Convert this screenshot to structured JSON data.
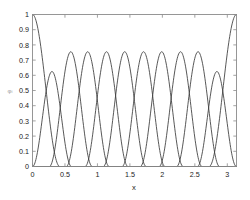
{
  "figure": {
    "background_color": "#ffffff",
    "frame_color": "#8c8c8c",
    "curve_color": "#3a3a3a"
  },
  "axes": {
    "xlabel": "x",
    "ylabel": "φᵢ",
    "x_ticks": [
      "0",
      "0.5",
      "1",
      "1.5",
      "2",
      "2.5",
      "3"
    ],
    "y_ticks": [
      "0",
      "0.1",
      "0.2",
      "0.3",
      "0.4",
      "0.5",
      "0.6",
      "0.7",
      "0.8",
      "0.9",
      "1"
    ]
  },
  "chart_data": {
    "type": "line",
    "title": "",
    "xlabel": "x",
    "ylabel": "φᵢ",
    "xlim": [
      0,
      3.14159
    ],
    "ylim": [
      0,
      1
    ],
    "xticks": [
      0,
      0.5,
      1,
      1.5,
      2,
      2.5,
      3
    ],
    "xticklabels": [
      "0",
      "0.5",
      "1",
      "1.5",
      "2",
      "2.5",
      "3"
    ],
    "yticks": [
      0,
      0.1,
      0.2,
      0.3,
      0.4,
      0.5,
      0.6,
      0.7,
      0.8,
      0.9,
      1
    ],
    "yticklabels": [
      "0",
      "0.1",
      "0.2",
      "0.3",
      "0.4",
      "0.5",
      "0.6",
      "0.7",
      "0.8",
      "0.9",
      "1"
    ],
    "grid": false,
    "legend": false,
    "legend_position": "none",
    "n_curves": 12,
    "peak_interior": 0.755,
    "peak_near_edge": 0.625,
    "crossing_upper": 0.5,
    "crossing_lower": 0.13,
    "series": [
      {
        "name": "phi_0",
        "type": "boundary-left",
        "peak_x": 0.0,
        "peak_y": 1.0,
        "support": [
          0.0,
          0.42
        ]
      },
      {
        "name": "phi_1",
        "type": "interior-edge",
        "peak_x": 0.275,
        "peak_y": 0.625,
        "support": [
          0.0,
          0.6
        ]
      },
      {
        "name": "phi_2",
        "type": "interior",
        "peak_x": 0.595,
        "peak_y": 0.755,
        "support": [
          0.26,
          0.92
        ]
      },
      {
        "name": "phi_3",
        "type": "interior",
        "peak_x": 0.855,
        "peak_y": 0.755,
        "support": [
          0.52,
          1.18
        ]
      },
      {
        "name": "phi_4",
        "type": "interior",
        "peak_x": 1.145,
        "peak_y": 0.755,
        "support": [
          0.81,
          1.47
        ]
      },
      {
        "name": "phi_5",
        "type": "interior",
        "peak_x": 1.42,
        "peak_y": 0.755,
        "support": [
          1.09,
          1.75
        ]
      },
      {
        "name": "phi_6",
        "type": "interior",
        "peak_x": 1.715,
        "peak_y": 0.755,
        "support": [
          1.38,
          2.04
        ]
      },
      {
        "name": "phi_7",
        "type": "interior",
        "peak_x": 1.995,
        "peak_y": 0.755,
        "support": [
          1.66,
          2.32
        ]
      },
      {
        "name": "phi_8",
        "type": "interior",
        "peak_x": 2.285,
        "peak_y": 0.755,
        "support": [
          1.95,
          2.61
        ]
      },
      {
        "name": "phi_9",
        "type": "interior",
        "peak_x": 2.545,
        "peak_y": 0.755,
        "support": [
          2.22,
          2.88
        ]
      },
      {
        "name": "phi_10",
        "type": "interior-edge",
        "peak_x": 2.865,
        "peak_y": 0.625,
        "support": [
          2.54,
          3.14
        ]
      },
      {
        "name": "phi_11",
        "type": "boundary-right",
        "peak_x": 3.14159,
        "peak_y": 1.0,
        "support": [
          2.72,
          3.14159
        ]
      }
    ]
  }
}
